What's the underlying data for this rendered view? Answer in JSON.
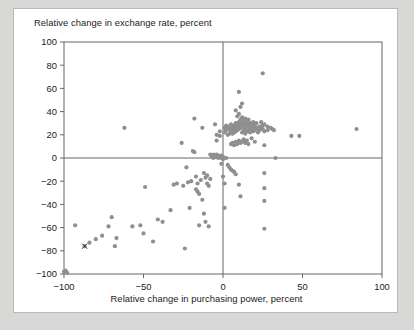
{
  "figure": {
    "title": "Relative change in exchange rate, percent",
    "xaxis_label": "Relative change in purchasing power, percent",
    "background_color": "#d8d8d6",
    "card_color": "#ffffff",
    "point_color": "#8f8f8f",
    "axis_color": "#666666",
    "text_color": "#1b1b1b"
  },
  "chart_data": {
    "type": "scatter",
    "title": "Relative change in exchange rate, percent",
    "xlabel": "Relative change in purchasing power, percent",
    "ylabel": "Relative change in exchange rate, percent",
    "xlim": [
      -100,
      100
    ],
    "ylim": [
      -100,
      100
    ],
    "xticks": [
      -100,
      -50,
      0,
      50,
      100
    ],
    "yticks": [
      -100,
      -80,
      -60,
      -40,
      -20,
      0,
      20,
      40,
      60,
      80,
      100
    ],
    "xtick_labels": [
      "-100",
      "-50",
      "0",
      "50",
      "100"
    ],
    "ytick_labels": [
      "100",
      "80",
      "60",
      "40",
      "20",
      "0",
      "-20",
      "-40",
      "-60",
      "-80",
      "-100"
    ],
    "grid": false,
    "legend": null,
    "zero_lines": true,
    "marker": "dot",
    "marker_size": 2.1,
    "highlight_marker": {
      "symbol": "x",
      "x": -87,
      "y": -76
    },
    "points": [
      [
        -100,
        -98
      ],
      [
        -99,
        -97
      ],
      [
        -98,
        -99
      ],
      [
        -93,
        -58
      ],
      [
        -87,
        -76
      ],
      [
        -84,
        -73
      ],
      [
        -80,
        -70
      ],
      [
        -76,
        -67
      ],
      [
        -72,
        -59
      ],
      [
        -70,
        -51
      ],
      [
        -68,
        -76
      ],
      [
        -67,
        -69
      ],
      [
        -62,
        26
      ],
      [
        -57,
        -59
      ],
      [
        -52,
        -58
      ],
      [
        -50,
        -65
      ],
      [
        -49,
        -25
      ],
      [
        -44,
        -72
      ],
      [
        -41,
        -53
      ],
      [
        -38,
        -55
      ],
      [
        -33,
        -45
      ],
      [
        -31,
        -23
      ],
      [
        -29,
        -22
      ],
      [
        -26,
        13
      ],
      [
        -25,
        -24
      ],
      [
        -24,
        -78
      ],
      [
        -23,
        -8
      ],
      [
        -22,
        -21
      ],
      [
        -21,
        -43
      ],
      [
        -20,
        -20
      ],
      [
        -19,
        6
      ],
      [
        -18,
        34
      ],
      [
        -18,
        5
      ],
      [
        -17,
        -16
      ],
      [
        -17,
        -27
      ],
      [
        -16,
        -22
      ],
      [
        -16,
        -29
      ],
      [
        -15,
        -58
      ],
      [
        -15,
        -31
      ],
      [
        -14,
        -19
      ],
      [
        -13,
        26
      ],
      [
        -13,
        -36
      ],
      [
        -12,
        -13
      ],
      [
        -12,
        -48
      ],
      [
        -11,
        -17
      ],
      [
        -11,
        -55
      ],
      [
        -10,
        -15
      ],
      [
        -10,
        -22
      ],
      [
        -9,
        -24
      ],
      [
        -9,
        -59
      ],
      [
        -8,
        3
      ],
      [
        -8,
        -18
      ],
      [
        -7,
        1
      ],
      [
        -7,
        2
      ],
      [
        -6,
        3
      ],
      [
        -6,
        0
      ],
      [
        -5,
        29
      ],
      [
        -5,
        2
      ],
      [
        -5,
        1
      ],
      [
        -4,
        20
      ],
      [
        -4,
        15
      ],
      [
        -4,
        3
      ],
      [
        -3,
        2
      ],
      [
        -3,
        1
      ],
      [
        -3,
        0
      ],
      [
        -2,
        23
      ],
      [
        -2,
        19
      ],
      [
        -2,
        1
      ],
      [
        -1,
        2
      ],
      [
        -1,
        0
      ],
      [
        -1,
        -5
      ],
      [
        0,
        1
      ],
      [
        0,
        0
      ],
      [
        0,
        -1
      ],
      [
        0,
        -16
      ],
      [
        1,
        26
      ],
      [
        1,
        22
      ],
      [
        1,
        -22
      ],
      [
        1,
        -43
      ],
      [
        2,
        28
      ],
      [
        2,
        24
      ],
      [
        2,
        0
      ],
      [
        3,
        27
      ],
      [
        3,
        20
      ],
      [
        3,
        -6
      ],
      [
        4,
        25
      ],
      [
        4,
        21
      ],
      [
        4,
        -8
      ],
      [
        5,
        29
      ],
      [
        5,
        26
      ],
      [
        5,
        23
      ],
      [
        5,
        12
      ],
      [
        5,
        -10
      ],
      [
        6,
        27
      ],
      [
        6,
        24
      ],
      [
        6,
        21
      ],
      [
        6,
        13
      ],
      [
        6,
        -11
      ],
      [
        7,
        28
      ],
      [
        7,
        25
      ],
      [
        7,
        22
      ],
      [
        7,
        11
      ],
      [
        7,
        -12
      ],
      [
        8,
        41
      ],
      [
        8,
        30
      ],
      [
        8,
        26
      ],
      [
        8,
        23
      ],
      [
        8,
        14
      ],
      [
        8,
        -14
      ],
      [
        9,
        36
      ],
      [
        9,
        29
      ],
      [
        9,
        27
      ],
      [
        9,
        24
      ],
      [
        9,
        12
      ],
      [
        10,
        57
      ],
      [
        10,
        38
      ],
      [
        10,
        31
      ],
      [
        10,
        28
      ],
      [
        10,
        25
      ],
      [
        10,
        15
      ],
      [
        10,
        -23
      ],
      [
        11,
        44
      ],
      [
        11,
        33
      ],
      [
        11,
        29
      ],
      [
        11,
        26
      ],
      [
        11,
        13
      ],
      [
        11,
        -33
      ],
      [
        12,
        47
      ],
      [
        12,
        35
      ],
      [
        12,
        30
      ],
      [
        12,
        27
      ],
      [
        12,
        22
      ],
      [
        12,
        14
      ],
      [
        13,
        32
      ],
      [
        13,
        28
      ],
      [
        13,
        24
      ],
      [
        13,
        16
      ],
      [
        14,
        34
      ],
      [
        14,
        29
      ],
      [
        14,
        25
      ],
      [
        14,
        21
      ],
      [
        14,
        13
      ],
      [
        15,
        31
      ],
      [
        15,
        27
      ],
      [
        15,
        23
      ],
      [
        15,
        15
      ],
      [
        16,
        33
      ],
      [
        16,
        28
      ],
      [
        16,
        24
      ],
      [
        16,
        12
      ],
      [
        17,
        30
      ],
      [
        17,
        26
      ],
      [
        17,
        22
      ],
      [
        18,
        29
      ],
      [
        18,
        25
      ],
      [
        18,
        17
      ],
      [
        19,
        31
      ],
      [
        19,
        27
      ],
      [
        19,
        23
      ],
      [
        20,
        28
      ],
      [
        20,
        24
      ],
      [
        20,
        14
      ],
      [
        21,
        30
      ],
      [
        21,
        26
      ],
      [
        22,
        25
      ],
      [
        22,
        22
      ],
      [
        23,
        27
      ],
      [
        23,
        24
      ],
      [
        24,
        31
      ],
      [
        24,
        26
      ],
      [
        25,
        73
      ],
      [
        25,
        28
      ],
      [
        25,
        25
      ],
      [
        26,
        29
      ],
      [
        26,
        23
      ],
      [
        26,
        11
      ],
      [
        26,
        -13
      ],
      [
        26,
        -26
      ],
      [
        26,
        -37
      ],
      [
        26,
        -61
      ],
      [
        28,
        27
      ],
      [
        28,
        24
      ],
      [
        30,
        26
      ],
      [
        31,
        25
      ],
      [
        32,
        24
      ],
      [
        33,
        0
      ],
      [
        43,
        19
      ],
      [
        48,
        19
      ],
      [
        84,
        25
      ]
    ]
  }
}
